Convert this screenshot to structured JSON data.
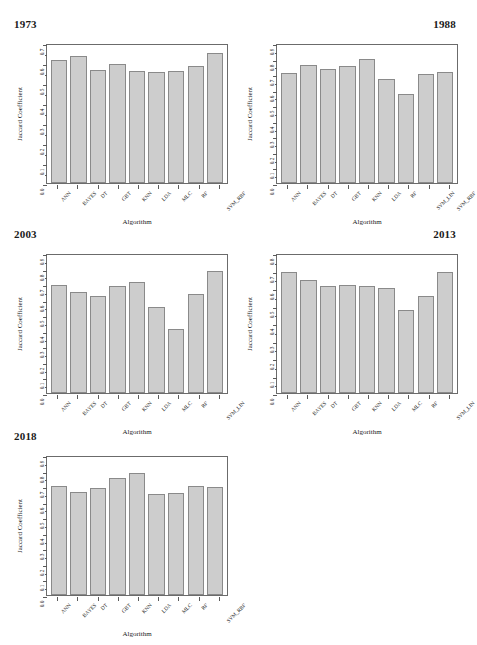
{
  "figure": {
    "axis_labels": {
      "x": "Algorithm",
      "y": "Jaccard Coefficient"
    },
    "bar_fill": "#cdcdcd",
    "bar_stroke": "#8a8a8a"
  },
  "chart_data": [
    {
      "type": "bar",
      "title": "1973",
      "xlabel": "Algorithm",
      "ylabel": "Jaccard Coefficient",
      "ylim": [
        0.0,
        0.7
      ],
      "yticks": [
        "0.0",
        "0.1",
        "0.2",
        "0.3",
        "0.4",
        "0.5",
        "0.6",
        "0.7"
      ],
      "grid": false,
      "legend": null,
      "categories": [
        "ANN",
        "BAYES",
        "DT",
        "GBT",
        "KNN",
        "LDA",
        "MLC",
        "RF",
        "SVM_RBF"
      ],
      "values": [
        0.615,
        0.635,
        0.567,
        0.596,
        0.56,
        0.557,
        0.56,
        0.584,
        0.648
      ]
    },
    {
      "type": "bar",
      "title": "1988",
      "xlabel": "Algorithm",
      "ylabel": "Jaccard Coefficient",
      "ylim": [
        0.0,
        0.9
      ],
      "yticks": [
        "0.0",
        "0.1",
        "0.2",
        "0.3",
        "0.4",
        "0.5",
        "0.6",
        "0.7",
        "0.8",
        "0.9"
      ],
      "grid": false,
      "legend": null,
      "categories": [
        "ANN",
        "BAYES",
        "DT",
        "GBT",
        "KNN",
        "LDA",
        "RF",
        "SVM_LIN",
        "SVM_RBF"
      ],
      "values": [
        0.71,
        0.76,
        0.735,
        0.75,
        0.795,
        0.668,
        0.575,
        0.702,
        0.712
      ]
    },
    {
      "type": "bar",
      "title": "2003",
      "xlabel": "Algorithm",
      "ylabel": "Jaccard Coefficient",
      "ylim": [
        0.0,
        0.9
      ],
      "yticks": [
        "0.0",
        "0.1",
        "0.2",
        "0.3",
        "0.4",
        "0.5",
        "0.6",
        "0.7",
        "0.8",
        "0.9"
      ],
      "grid": false,
      "legend": null,
      "categories": [
        "ANN",
        "BAYES",
        "DT",
        "GBT",
        "KNN",
        "LDA",
        "MLC",
        "RF",
        "SVM_LIN"
      ],
      "values": [
        0.695,
        0.652,
        0.622,
        0.688,
        0.713,
        0.552,
        0.413,
        0.637,
        0.783
      ]
    },
    {
      "type": "bar",
      "title": "2013",
      "xlabel": "Algorithm",
      "ylabel": "Jaccard Coefficient",
      "ylim": [
        0.0,
        0.8
      ],
      "yticks": [
        "0.0",
        "0.1",
        "0.2",
        "0.3",
        "0.4",
        "0.5",
        "0.6",
        "0.7",
        "0.8"
      ],
      "grid": false,
      "legend": null,
      "categories": [
        "ANN",
        "BAYES",
        "DT",
        "GBT",
        "KNN",
        "LDA",
        "MLC",
        "RF",
        "SVM_LIN"
      ],
      "values": [
        0.69,
        0.648,
        0.612,
        0.618,
        0.614,
        0.6,
        0.474,
        0.556,
        0.692
      ]
    },
    {
      "type": "bar",
      "title": "2018",
      "xlabel": "Algorithm",
      "ylabel": "Jaccard Coefficient",
      "ylim": [
        0.0,
        0.9
      ],
      "yticks": [
        "0.0",
        "0.1",
        "0.2",
        "0.3",
        "0.4",
        "0.5",
        "0.6",
        "0.7",
        "0.8",
        "0.9"
      ],
      "grid": false,
      "legend": null,
      "categories": [
        "ANN",
        "BAYES",
        "DT",
        "GBT",
        "KNN",
        "LDA",
        "MLC",
        "RF",
        "SVM_RBF"
      ],
      "values": [
        0.699,
        0.663,
        0.686,
        0.753,
        0.783,
        0.652,
        0.656,
        0.704,
        0.693
      ]
    }
  ]
}
